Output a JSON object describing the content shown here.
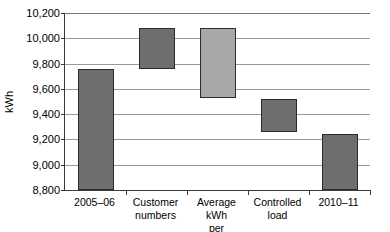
{
  "chart_data": {
    "type": "bar",
    "subtype": "waterfall",
    "title": "",
    "xlabel": "",
    "ylabel": "kWh",
    "ylim": [
      8800,
      10200
    ],
    "grid": true,
    "legend": "none",
    "y_ticks": [
      10200,
      10000,
      9800,
      9600,
      9400,
      9200,
      9000,
      8800
    ],
    "y_tick_labels": [
      "10,200",
      "10,000",
      "9,800",
      "9,600",
      "9,400",
      "9,200",
      "9,000",
      "8,800"
    ],
    "categories": [
      "2005–06",
      "Customer numbers",
      "Average kWh per customer",
      "Controlled load",
      "2010–11"
    ],
    "category_lines": [
      [
        "2005–06"
      ],
      [
        "Customer",
        "numbers"
      ],
      [
        "Average kWh",
        "per customer"
      ],
      [
        "Controlled",
        "load"
      ],
      [
        "2010–11"
      ]
    ],
    "bars": [
      {
        "label": "2005–06",
        "base": 8800,
        "top": 9760,
        "value": 9760,
        "kind": "total",
        "color": "#6e6e6e"
      },
      {
        "label": "Customer numbers",
        "base": 9760,
        "top": 10080,
        "value": 320,
        "kind": "increase",
        "color": "#6e6e6e"
      },
      {
        "label": "Average kWh per customer",
        "base": 9530,
        "top": 10080,
        "value": -550,
        "kind": "decrease",
        "color": "#a8a8a8"
      },
      {
        "label": "Controlled load",
        "base": 9260,
        "top": 9520,
        "value": -260,
        "kind": "decrease",
        "color": "#6e6e6e"
      },
      {
        "label": "2010–11",
        "base": 8800,
        "top": 9240,
        "value": 9240,
        "kind": "total",
        "color": "#6e6e6e"
      }
    ],
    "colors": {
      "bar_dark": "#6e6e6e",
      "bar_light": "#a8a8a8",
      "bar_outline": "#2b2b2b",
      "gridline": "#999999",
      "axis": "#3a3a3a",
      "background": "#ffffff",
      "text": "#000000"
    }
  }
}
